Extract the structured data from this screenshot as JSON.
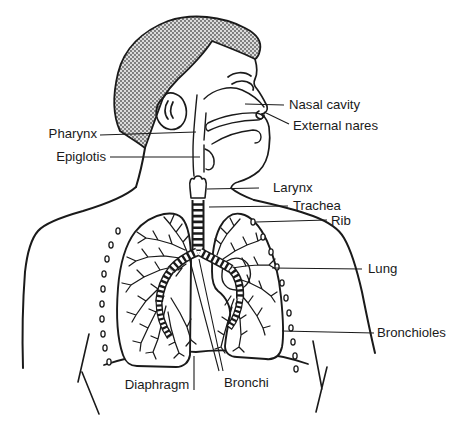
{
  "diagram": {
    "colors": {
      "line": "#1a1a1a",
      "background": "#ffffff",
      "hair_fill": "#dcdcdc",
      "hair_stipple": "#555555"
    },
    "labels": {
      "pharynx": "Pharynx",
      "epiglotis": "Epiglotis",
      "nasal_cavity": "Nasal cavity",
      "external_nares": "External nares",
      "larynx": "Larynx",
      "trachea": "Trachea",
      "rib": "Rib",
      "lung": "Lung",
      "bronchioles": "Bronchioles",
      "diaphragm": "Diaphragm",
      "bronchi": "Bronchi"
    }
  }
}
